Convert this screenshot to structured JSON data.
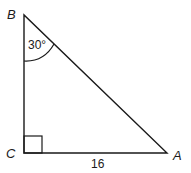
{
  "diagram": {
    "type": "right-triangle",
    "vertices": {
      "B": {
        "label": "B"
      },
      "C": {
        "label": "C"
      },
      "A": {
        "label": "A"
      }
    },
    "angle_B": {
      "label": "30°"
    },
    "right_angle_at": "C",
    "side_CA": {
      "label": "16"
    },
    "colors": {
      "stroke": "#1a1a1a",
      "background": "#ffffff"
    }
  }
}
